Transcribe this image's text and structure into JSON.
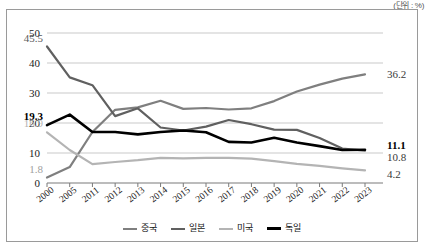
{
  "unit_note": "(단위 : %)",
  "chart_data": {
    "type": "line",
    "title": "",
    "xlabel": "",
    "ylabel": "",
    "ylim": [
      0,
      50
    ],
    "yticks": [
      0,
      10,
      20,
      30,
      40,
      50
    ],
    "grid": true,
    "legend_position": "bottom",
    "categories": [
      "2000",
      "2005",
      "2011",
      "2012",
      "2013",
      "2014",
      "2015",
      "2016",
      "2017",
      "2018",
      "2019",
      "2020",
      "2021",
      "2022",
      "2023"
    ],
    "series": [
      {
        "name": "중국",
        "color": "#7f7f7f",
        "width": 2.2,
        "values": [
          1.8,
          5.3,
          17.0,
          24.4,
          25.2,
          27.4,
          24.7,
          25.0,
          24.5,
          24.9,
          27.3,
          30.5,
          32.8,
          34.8,
          36.2
        ],
        "start_label": "1.8",
        "end_label": "36.2"
      },
      {
        "name": "일본",
        "color": "#606060",
        "width": 2.2,
        "values": [
          45.5,
          35.2,
          32.6,
          22.3,
          24.9,
          18.5,
          17.5,
          18.8,
          21.0,
          19.6,
          17.8,
          17.7,
          15.0,
          11.5,
          10.8
        ],
        "start_label": "45.5",
        "end_label": "10.8"
      },
      {
        "name": "미국",
        "color": "#b4b4b4",
        "width": 2.2,
        "values": [
          16.9,
          11.0,
          6.3,
          7.0,
          7.6,
          8.4,
          8.2,
          8.4,
          8.4,
          8.1,
          7.3,
          6.4,
          5.7,
          4.9,
          4.2
        ],
        "start_label": "16.9",
        "end_label": "4.2"
      },
      {
        "name": "독일",
        "color": "#000000",
        "width": 2.6,
        "values": [
          19.3,
          22.8,
          17.0,
          17.0,
          16.2,
          17.0,
          17.5,
          16.9,
          13.7,
          13.5,
          15.1,
          13.5,
          12.3,
          11.0,
          11.1
        ],
        "start_label": "19.3",
        "end_label": "11.1"
      }
    ],
    "point_labels": {
      "left": [
        {
          "text": "45.5",
          "series": "일본",
          "color": "#5a5a5a",
          "bold": false
        },
        {
          "text": "19.3",
          "series": "독일",
          "color": "#000000",
          "bold": true
        },
        {
          "text": "16.9",
          "series": "미국",
          "color": "#b4b4b4",
          "bold": false
        },
        {
          "text": "1.8",
          "series": "중국",
          "color": "#a0a0a0",
          "bold": false
        }
      ],
      "right": [
        {
          "text": "36.2",
          "series": "중국",
          "color": "#3a3a3a",
          "bold": false
        },
        {
          "text": "11.1",
          "series": "독일",
          "color": "#000000",
          "bold": true
        },
        {
          "text": "10.8",
          "series": "일본",
          "color": "#3a3a3a",
          "bold": false
        },
        {
          "text": "4.2",
          "series": "미국",
          "color": "#3a3a3a",
          "bold": false
        }
      ]
    }
  },
  "legend": {
    "items": [
      {
        "label": "중국",
        "color": "#7f7f7f",
        "width": 2.2
      },
      {
        "label": "일본",
        "color": "#606060",
        "width": 2.2
      },
      {
        "label": "미국",
        "color": "#b4b4b4",
        "width": 2.2
      },
      {
        "label": "독일",
        "color": "#000000",
        "width": 3
      }
    ]
  }
}
